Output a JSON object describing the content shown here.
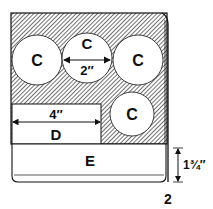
{
  "figure": {
    "number": "2",
    "labels": {
      "circle_top_left": "C",
      "circle_top_middle": "C",
      "circle_top_right": "C",
      "circle_lower_right": "C",
      "block_d": "D",
      "base_e": "E"
    },
    "dimensions": {
      "circle_diameter": "2″",
      "block_d_width": "4″",
      "base_e_thickness": "1¾″"
    }
  }
}
